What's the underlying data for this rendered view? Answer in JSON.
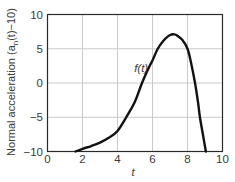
{
  "chart_data": {
    "type": "line",
    "title": "",
    "xlabel": "t",
    "ylabel": "Normal acceleration (a_n(t)−10)",
    "ylabel_parts": {
      "prefix": "Normal acceleration (a",
      "subscript": "n",
      "suffix": "(t)−10)"
    },
    "xlim": [
      0,
      10
    ],
    "ylim": [
      -10,
      10
    ],
    "x_ticks": [
      0,
      2,
      4,
      6,
      8,
      10
    ],
    "y_ticks": [
      10,
      5,
      0,
      -5,
      -10
    ],
    "x_tick_labels": [
      "0",
      "2",
      "4",
      "6",
      "8",
      "10"
    ],
    "y_tick_labels": [
      "10",
      "5",
      "0",
      "−5",
      "−10"
    ],
    "grid": true,
    "legend": null,
    "annotations": [
      {
        "text": "f(t)",
        "x": 4.95,
        "y": 1.55
      }
    ],
    "series": [
      {
        "name": "f(t)",
        "x": [
          1.6,
          2.0,
          2.5,
          3.0,
          3.5,
          4.0,
          4.5,
          5.0,
          5.4,
          5.8,
          6.0,
          6.3,
          6.6,
          6.9,
          7.1,
          7.23,
          7.4,
          7.7,
          8.0,
          8.2,
          8.43,
          8.6,
          8.71,
          8.9,
          9.05
        ],
        "values": [
          -10,
          -9.6,
          -9.2,
          -8.7,
          -8.0,
          -7.0,
          -5.0,
          -2.7,
          0,
          2.3,
          3.3,
          5.0,
          6.1,
          6.85,
          7.08,
          7.1,
          6.95,
          6.3,
          5.0,
          3.0,
          0,
          -2.8,
          -5.0,
          -7.8,
          -10
        ]
      }
    ]
  }
}
